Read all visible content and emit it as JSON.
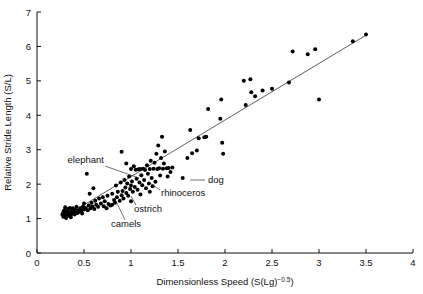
{
  "chart_data": {
    "type": "scatter",
    "title": "",
    "xlabel": "Dimensionless Speed (S(Lg)",
    "xlabel_exponent": "−0.5",
    "xlabel_tail": ")",
    "ylabel": "Relative Stride Length (S/L)",
    "xlim": [
      0,
      4
    ],
    "ylim": [
      0,
      7
    ],
    "xticks": [
      0,
      0.5,
      1,
      1.5,
      2,
      2.5,
      3,
      3.5,
      4
    ],
    "xtick_labels": [
      "0",
      "0.5",
      "1",
      "1.5",
      "2",
      "2.5",
      "3",
      "3.5",
      "4"
    ],
    "yticks": [
      0,
      1,
      2,
      3,
      4,
      5,
      6,
      7
    ],
    "ytick_labels": [
      "0",
      "1",
      "2",
      "3",
      "4",
      "5",
      "6",
      "7"
    ],
    "grid": false,
    "legend": "none",
    "marker_color": "#000000",
    "marker_size": 2.0,
    "fit_line": {
      "label": "regression line",
      "color": "#333333",
      "x_start": 0.27,
      "y_start": 1.02,
      "x_end": 3.52,
      "y_end": 6.36
    },
    "points": [
      [
        0.27,
        1.12
      ],
      [
        0.28,
        1.18
      ],
      [
        0.28,
        1.05
      ],
      [
        0.29,
        1.24
      ],
      [
        0.3,
        1.1
      ],
      [
        0.3,
        1.33
      ],
      [
        0.31,
        1.16
      ],
      [
        0.31,
        1.02
      ],
      [
        0.32,
        1.2
      ],
      [
        0.33,
        1.12
      ],
      [
        0.33,
        1.28
      ],
      [
        0.34,
        1.08
      ],
      [
        0.35,
        1.18
      ],
      [
        0.35,
        1.31
      ],
      [
        0.36,
        1.12
      ],
      [
        0.36,
        1.04
      ],
      [
        0.37,
        1.22
      ],
      [
        0.38,
        1.15
      ],
      [
        0.38,
        1.3
      ],
      [
        0.39,
        1.19
      ],
      [
        0.4,
        1.12
      ],
      [
        0.4,
        1.26
      ],
      [
        0.41,
        1.18
      ],
      [
        0.42,
        1.22
      ],
      [
        0.42,
        1.34
      ],
      [
        0.43,
        1.16
      ],
      [
        0.44,
        1.24
      ],
      [
        0.45,
        1.2
      ],
      [
        0.46,
        1.3
      ],
      [
        0.47,
        1.22
      ],
      [
        0.48,
        1.15
      ],
      [
        0.49,
        1.35
      ],
      [
        0.5,
        1.26
      ],
      [
        0.5,
        1.44
      ],
      [
        0.52,
        1.31
      ],
      [
        0.53,
        2.3
      ],
      [
        0.54,
        1.24
      ],
      [
        0.55,
        1.38
      ],
      [
        0.56,
        1.72
      ],
      [
        0.57,
        1.3
      ],
      [
        0.58,
        1.46
      ],
      [
        0.59,
        1.35
      ],
      [
        0.6,
        1.88
      ],
      [
        0.61,
        1.28
      ],
      [
        0.62,
        1.52
      ],
      [
        0.63,
        1.4
      ],
      [
        0.65,
        1.34
      ],
      [
        0.66,
        1.58
      ],
      [
        0.68,
        1.44
      ],
      [
        0.7,
        1.62
      ],
      [
        0.71,
        1.36
      ],
      [
        0.72,
        1.5
      ],
      [
        0.74,
        1.3
      ],
      [
        0.75,
        1.66
      ],
      [
        0.76,
        1.42
      ],
      [
        0.78,
        1.38
      ],
      [
        0.8,
        1.72
      ],
      [
        0.8,
        1.4
      ],
      [
        0.82,
        1.54
      ],
      [
        0.83,
        1.46
      ],
      [
        0.84,
        1.96
      ],
      [
        0.85,
        1.62
      ],
      [
        0.86,
        1.78
      ],
      [
        0.88,
        1.52
      ],
      [
        0.89,
        2.05
      ],
      [
        0.9,
        1.68
      ],
      [
        0.9,
        2.94
      ],
      [
        0.91,
        1.8
      ],
      [
        0.92,
        1.58
      ],
      [
        0.93,
        2.12
      ],
      [
        0.94,
        1.9
      ],
      [
        0.95,
        2.6
      ],
      [
        0.95,
        1.74
      ],
      [
        0.96,
        2.02
      ],
      [
        0.97,
        1.66
      ],
      [
        0.98,
        2.22
      ],
      [
        0.99,
        1.86
      ],
      [
        1.0,
        2.44
      ],
      [
        1.0,
        1.96
      ],
      [
        1.0,
        1.5
      ],
      [
        1.01,
        2.08
      ],
      [
        1.02,
        1.78
      ],
      [
        1.03,
        2.52
      ],
      [
        1.04,
        1.92
      ],
      [
        1.05,
        2.42
      ],
      [
        1.06,
        2.16
      ],
      [
        1.07,
        1.84
      ],
      [
        1.08,
        2.43
      ],
      [
        1.09,
        2.05
      ],
      [
        1.1,
        2.44
      ],
      [
        1.1,
        1.7
      ],
      [
        1.11,
        2.26
      ],
      [
        1.12,
        1.97
      ],
      [
        1.13,
        2.45
      ],
      [
        1.14,
        2.12
      ],
      [
        1.15,
        2.41
      ],
      [
        1.16,
        1.88
      ],
      [
        1.17,
        2.55
      ],
      [
        1.18,
        2.3
      ],
      [
        1.19,
        2.02
      ],
      [
        1.2,
        2.44
      ],
      [
        1.2,
        1.78
      ],
      [
        1.21,
        2.68
      ],
      [
        1.22,
        2.18
      ],
      [
        1.23,
        1.94
      ],
      [
        1.24,
        2.45
      ],
      [
        1.25,
        2.62
      ],
      [
        1.26,
        2.07
      ],
      [
        1.27,
        2.88
      ],
      [
        1.28,
        2.44
      ],
      [
        1.29,
        3.12
      ],
      [
        1.3,
        2.46
      ],
      [
        1.31,
        2.25
      ],
      [
        1.32,
        2.76
      ],
      [
        1.33,
        3.38
      ],
      [
        1.34,
        2.45
      ],
      [
        1.35,
        2.6
      ],
      [
        1.36,
        2.95
      ],
      [
        1.38,
        2.46
      ],
      [
        1.39,
        2.22
      ],
      [
        1.4,
        2.47
      ],
      [
        1.42,
        2.35
      ],
      [
        1.44,
        2.48
      ],
      [
        1.55,
        2.18
      ],
      [
        1.6,
        2.76
      ],
      [
        1.63,
        3.57
      ],
      [
        1.65,
        2.9
      ],
      [
        1.7,
        2.98
      ],
      [
        1.72,
        3.33
      ],
      [
        1.78,
        3.36
      ],
      [
        1.8,
        3.38
      ],
      [
        1.82,
        4.18
      ],
      [
        1.95,
        3.9
      ],
      [
        1.96,
        4.46
      ],
      [
        1.97,
        3.2
      ],
      [
        1.98,
        2.88
      ],
      [
        2.2,
        5.0
      ],
      [
        2.22,
        4.3
      ],
      [
        2.27,
        5.05
      ],
      [
        2.28,
        4.67
      ],
      [
        2.32,
        4.55
      ],
      [
        2.4,
        4.72
      ],
      [
        2.5,
        4.77
      ],
      [
        2.68,
        4.95
      ],
      [
        2.72,
        5.85
      ],
      [
        2.88,
        5.77
      ],
      [
        2.96,
        5.92
      ],
      [
        3.0,
        4.46
      ],
      [
        3.36,
        6.15
      ],
      [
        3.5,
        6.35
      ]
    ],
    "annotations": [
      {
        "label": "elephant",
        "label_x": 104,
        "label_y": 163,
        "anchor": "end",
        "leader": [
          [
            105,
            166
          ],
          [
            139,
            178
          ]
        ]
      },
      {
        "label": "camels",
        "label_x": 111,
        "label_y": 227,
        "anchor": "start",
        "leader": [
          [
            125,
            220
          ],
          [
            116,
            201
          ]
        ]
      },
      {
        "label": "ostrich",
        "label_x": 134,
        "label_y": 212,
        "anchor": "start",
        "leader": [
          [
            136,
            205
          ],
          [
            131,
            196
          ]
        ]
      },
      {
        "label": "rhinoceros",
        "label_x": 161,
        "label_y": 196,
        "anchor": "start",
        "leader": [
          [
            160,
            190
          ],
          [
            150,
            183
          ]
        ]
      },
      {
        "label": "dog",
        "label_x": 208,
        "label_y": 183,
        "anchor": "start",
        "leader": [
          [
            190,
            180
          ],
          [
            205,
            180
          ]
        ]
      }
    ]
  }
}
